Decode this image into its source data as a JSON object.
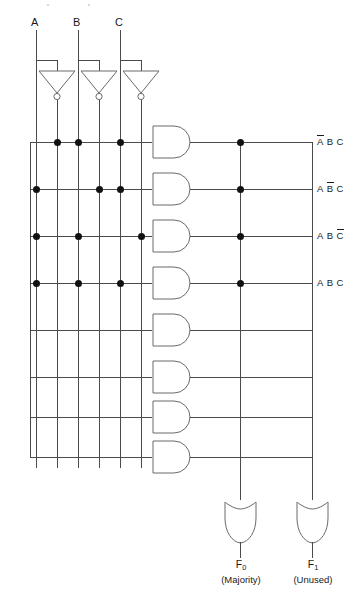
{
  "diagram": {
    "kind": "logic-circuit",
    "title_visible": false,
    "inputs": [
      {
        "name": "A",
        "label": "A",
        "x": 36
      },
      {
        "name": "B",
        "label": "B",
        "x": 78
      },
      {
        "name": "C",
        "label": "C",
        "x": 120
      }
    ],
    "inverters": [
      {
        "name": "inverter-a",
        "input_label": "A",
        "output_label": "A-bar",
        "x": 57
      },
      {
        "name": "inverter-b",
        "input_label": "B",
        "output_label": "B-bar",
        "x": 99
      },
      {
        "name": "inverter-c",
        "input_label": "C",
        "output_label": "C-bar",
        "x": 141
      }
    ],
    "rails": [
      {
        "name": "rail-a",
        "signal": "A",
        "x": 36,
        "inverted": false
      },
      {
        "name": "rail-a-bar",
        "signal": "A",
        "x": 57,
        "inverted": true
      },
      {
        "name": "rail-b",
        "signal": "B",
        "x": 78,
        "inverted": false
      },
      {
        "name": "rail-b-bar",
        "signal": "B",
        "x": 99,
        "inverted": true
      },
      {
        "name": "rail-c",
        "signal": "C",
        "x": 120,
        "inverted": false
      },
      {
        "name": "rail-c-bar",
        "signal": "C",
        "x": 141,
        "inverted": true
      }
    ],
    "and_gates": [
      {
        "name": "and-gate-1",
        "y": 142,
        "product_term": "A-bar B C",
        "connected_rails": [
          57,
          78,
          120
        ],
        "used": true,
        "to_f0": true,
        "to_f1": false
      },
      {
        "name": "and-gate-2",
        "y": 189,
        "product_term": "A B-bar C",
        "connected_rails": [
          36,
          99,
          120
        ],
        "used": true,
        "to_f0": true,
        "to_f1": false
      },
      {
        "name": "and-gate-3",
        "y": 236,
        "product_term": "A B C-bar",
        "connected_rails": [
          36,
          78,
          141
        ],
        "used": true,
        "to_f0": true,
        "to_f1": false
      },
      {
        "name": "and-gate-4",
        "y": 283,
        "product_term": "A B C",
        "connected_rails": [
          36,
          78,
          120
        ],
        "used": true,
        "to_f0": true,
        "to_f1": false
      },
      {
        "name": "and-gate-5",
        "y": 330,
        "product_term": "",
        "connected_rails": [],
        "used": false,
        "to_f0": false,
        "to_f1": false
      },
      {
        "name": "and-gate-6",
        "y": 377,
        "product_term": "",
        "connected_rails": [],
        "used": false,
        "to_f0": false,
        "to_f1": false
      },
      {
        "name": "and-gate-7",
        "y": 417,
        "product_term": "",
        "connected_rails": [],
        "used": false,
        "to_f0": false,
        "to_f1": false
      },
      {
        "name": "and-gate-8",
        "y": 457,
        "product_term": "",
        "connected_rails": [],
        "used": false,
        "to_f0": false,
        "to_f1": false
      }
    ],
    "term_labels": [
      {
        "name": "term-label-1",
        "y": 142,
        "parts": [
          {
            "t": "A",
            "bar": true
          },
          {
            "t": "B",
            "bar": false
          },
          {
            "t": "C",
            "bar": false
          }
        ]
      },
      {
        "name": "term-label-2",
        "y": 189,
        "parts": [
          {
            "t": "A",
            "bar": false
          },
          {
            "t": "B",
            "bar": true
          },
          {
            "t": "C",
            "bar": false
          }
        ]
      },
      {
        "name": "term-label-3",
        "y": 236,
        "parts": [
          {
            "t": "A",
            "bar": false
          },
          {
            "t": "B",
            "bar": false
          },
          {
            "t": "C",
            "bar": true
          }
        ]
      },
      {
        "name": "term-label-4",
        "y": 283,
        "parts": [
          {
            "t": "A",
            "bar": false
          },
          {
            "t": "B",
            "bar": false
          },
          {
            "t": "C",
            "bar": false
          }
        ]
      }
    ],
    "or_buses": [
      {
        "name": "or-bus-f0",
        "x": 240,
        "dot_rows": [
          142,
          189,
          236,
          283
        ]
      },
      {
        "name": "or-bus-f1",
        "x": 312,
        "dot_rows": []
      }
    ],
    "or_gates": [
      {
        "name": "or-gate-f0",
        "x": 240,
        "y": 500,
        "output": "F0",
        "output_sub": "0",
        "note": "(Majority)"
      },
      {
        "name": "or-gate-f1",
        "x": 312,
        "y": 500,
        "output": "F1",
        "output_sub": "1",
        "note": "(Unused)"
      }
    ],
    "outputs": [
      {
        "name": "output-f0",
        "base": "F",
        "sub": "0",
        "note": "(Majority)",
        "x": 240
      },
      {
        "name": "output-f1",
        "base": "F",
        "sub": "1",
        "note": "(Unused)",
        "x": 312
      }
    ],
    "colors": {
      "wire": "#4a4a4a",
      "gate_stroke": "#6a6a6a",
      "dot": "#111111",
      "text": "#1a1a1a",
      "background": "#ffffff"
    }
  }
}
